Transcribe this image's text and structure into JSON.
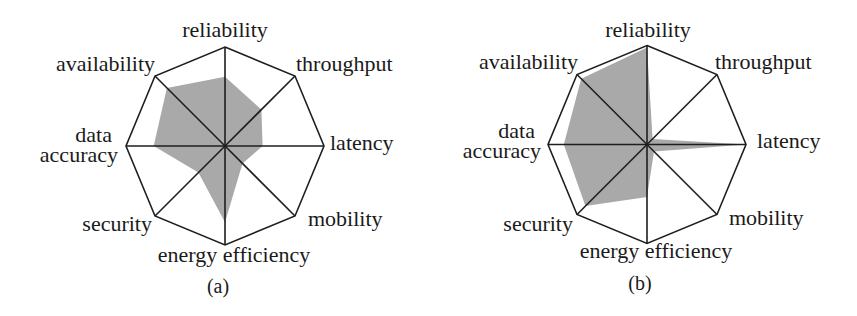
{
  "chart_data": [
    {
      "id": "a",
      "type": "radar",
      "caption": "(a)",
      "center": [
        225,
        146
      ],
      "radius": 99,
      "range": [
        0,
        1
      ],
      "grid": "octagon outline with spokes",
      "fill_color": "#a9a9a9",
      "axes": [
        "reliability",
        "throughput",
        "latency",
        "mobility",
        "energy efficiency",
        "security",
        "data accuracy",
        "availability"
      ],
      "values": [
        0.7,
        0.52,
        0.38,
        0.25,
        0.77,
        0.38,
        0.72,
        0.83
      ],
      "labels": [
        {
          "text": "reliability",
          "x": 225,
          "y": 37,
          "anchor": "middle"
        },
        {
          "text": "throughput",
          "x": 296,
          "y": 71,
          "anchor": "start"
        },
        {
          "text": "latency",
          "x": 330,
          "y": 150,
          "anchor": "start"
        },
        {
          "text": "mobility",
          "x": 308,
          "y": 226,
          "anchor": "start"
        },
        {
          "text": "energy efficiency",
          "x": 234,
          "y": 262,
          "anchor": "middle"
        },
        {
          "text": "security",
          "x": 152,
          "y": 231,
          "anchor": "end"
        },
        {
          "text": "data",
          "x": 112,
          "y": 142,
          "anchor": "end"
        },
        {
          "text": "accuracy",
          "x": 118,
          "y": 162,
          "anchor": "end"
        },
        {
          "text": "availability",
          "x": 155,
          "y": 71,
          "anchor": "end"
        }
      ],
      "caption_pos": [
        218,
        293
      ]
    },
    {
      "id": "b",
      "type": "radar",
      "caption": "(b)",
      "center": [
        647,
        144.5
      ],
      "radius": 99,
      "range": [
        0,
        1
      ],
      "grid": "octagon outline with spokes",
      "fill_color": "#a9a9a9",
      "axes": [
        "reliability",
        "throughput",
        "latency",
        "mobility",
        "energy efficiency",
        "security",
        "data accuracy",
        "availability"
      ],
      "values": [
        0.98,
        0.08,
        1.0,
        0.1,
        0.53,
        0.88,
        0.84,
        0.94
      ],
      "labels": [
        {
          "text": "reliability",
          "x": 648,
          "y": 37,
          "anchor": "middle"
        },
        {
          "text": "throughput",
          "x": 715,
          "y": 69,
          "anchor": "start"
        },
        {
          "text": "latency",
          "x": 757,
          "y": 148,
          "anchor": "start"
        },
        {
          "text": "mobility",
          "x": 729,
          "y": 225,
          "anchor": "start"
        },
        {
          "text": "energy efficiency",
          "x": 656,
          "y": 258,
          "anchor": "middle"
        },
        {
          "text": "security",
          "x": 573,
          "y": 231,
          "anchor": "end"
        },
        {
          "text": "data",
          "x": 535,
          "y": 138,
          "anchor": "end"
        },
        {
          "text": "accuracy",
          "x": 541,
          "y": 158,
          "anchor": "end"
        },
        {
          "text": "availability",
          "x": 578,
          "y": 69,
          "anchor": "end"
        }
      ],
      "caption_pos": [
        640,
        290
      ]
    }
  ],
  "figure": {
    "panel_a_caption": "(a)",
    "panel_b_caption": "(b)"
  }
}
